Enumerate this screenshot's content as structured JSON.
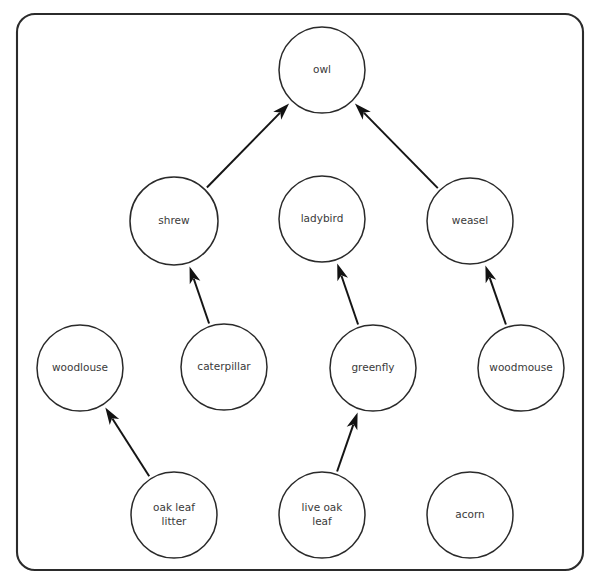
{
  "diagram": {
    "type": "directed-graph",
    "frame": {
      "shape": "rounded-rectangle",
      "stroke_color": "#2b2b2b",
      "corner_radius": 18
    },
    "node_style": {
      "fill_color": "#ffffff",
      "stroke_color": "#2a2a2a",
      "text_color": "#3a3a3a",
      "radius": 43
    },
    "edge_style": {
      "stroke_color": "#151515",
      "arrowhead": "filled-triangle",
      "direction": "points-to-consumer"
    },
    "nodes": [
      {
        "id": "owl",
        "label": "owl",
        "lines": [
          "owl"
        ],
        "cx": 322,
        "cy": 70,
        "r": 43,
        "row": 1
      },
      {
        "id": "shrew",
        "label": "shrew",
        "lines": [
          "shrew"
        ],
        "cx": 174,
        "cy": 221,
        "r": 44,
        "row": 2
      },
      {
        "id": "ladybird",
        "label": "ladybird",
        "lines": [
          "ladybird"
        ],
        "cx": 322,
        "cy": 219,
        "r": 43,
        "row": 2
      },
      {
        "id": "weasel",
        "label": "weasel",
        "lines": [
          "weasel"
        ],
        "cx": 470,
        "cy": 221,
        "r": 43,
        "row": 2
      },
      {
        "id": "woodlouse",
        "label": "woodlouse",
        "lines": [
          "woodlouse"
        ],
        "cx": 80,
        "cy": 368,
        "r": 43,
        "row": 3
      },
      {
        "id": "caterpillar",
        "label": "caterpillar",
        "lines": [
          "caterpillar"
        ],
        "cx": 224,
        "cy": 367,
        "r": 43,
        "row": 3
      },
      {
        "id": "greenfly",
        "label": "greenfly",
        "lines": [
          "greenfly"
        ],
        "cx": 373,
        "cy": 368,
        "r": 43,
        "row": 3
      },
      {
        "id": "woodmouse",
        "label": "woodmouse",
        "lines": [
          "woodmouse"
        ],
        "cx": 521,
        "cy": 368,
        "r": 43,
        "row": 3
      },
      {
        "id": "oak-leaf-litter",
        "label": "oak leaf litter",
        "lines": [
          "oak leaf",
          "litter"
        ],
        "cx": 174,
        "cy": 515,
        "r": 43,
        "row": 4
      },
      {
        "id": "live-oak-leaf",
        "label": "live oak leaf",
        "lines": [
          "live oak",
          "leaf"
        ],
        "cx": 322,
        "cy": 515,
        "r": 43,
        "row": 4
      },
      {
        "id": "acorn",
        "label": "acorn",
        "lines": [
          "acorn"
        ],
        "cx": 470,
        "cy": 515,
        "r": 43,
        "row": 4
      }
    ],
    "edges": [
      {
        "id": "edge-shrew-owl",
        "from": "shrew",
        "to": "owl"
      },
      {
        "id": "edge-weasel-owl",
        "from": "weasel",
        "to": "owl"
      },
      {
        "id": "edge-caterpillar-shrew",
        "from": "caterpillar",
        "to": "shrew"
      },
      {
        "id": "edge-greenfly-ladybird",
        "from": "greenfly",
        "to": "ladybird"
      },
      {
        "id": "edge-woodmouse-weasel",
        "from": "woodmouse",
        "to": "weasel"
      },
      {
        "id": "edge-oak-leaf-litter-woodlouse",
        "from": "oak-leaf-litter",
        "to": "woodlouse"
      },
      {
        "id": "edge-live-oak-leaf-greenfly",
        "from": "live-oak-leaf",
        "to": "greenfly"
      }
    ]
  }
}
